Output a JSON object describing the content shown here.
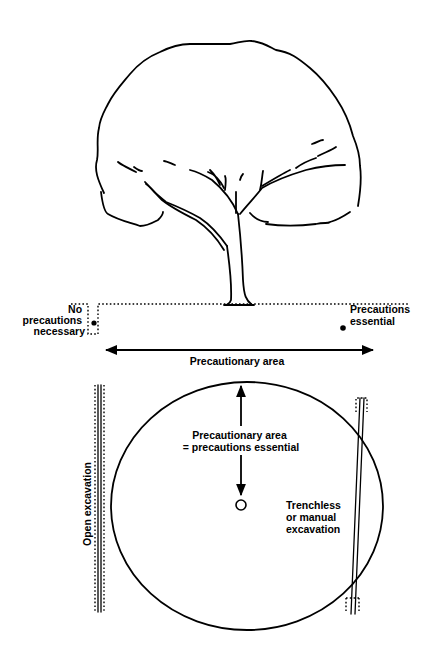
{
  "diagram": {
    "elevation": {
      "left_label": [
        "No",
        "precautions",
        "necessary"
      ],
      "right_label": [
        "Precautions",
        "essential"
      ],
      "span_label": "Precautionary area"
    },
    "plan": {
      "centre_label": [
        "Precautionary area",
        "= precautions essential"
      ],
      "left_label": "Open excavation",
      "right_label": [
        "Trenchless",
        "or manual",
        "excavation"
      ]
    },
    "colors": {
      "ink": "#000000",
      "background": "#ffffff"
    }
  }
}
